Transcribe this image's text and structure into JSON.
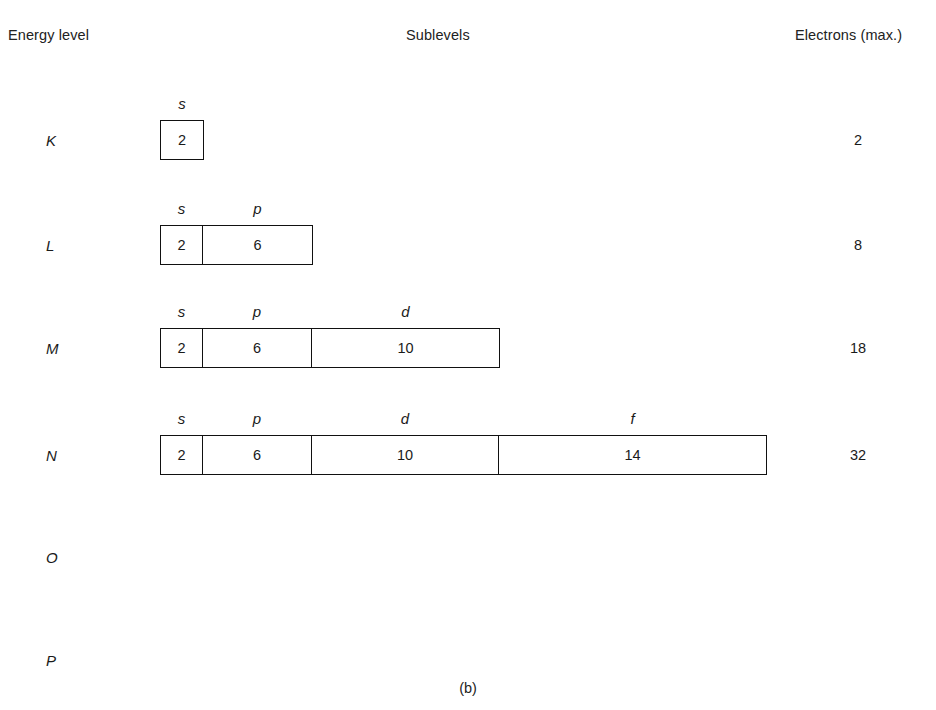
{
  "headers": {
    "energy_level": "Energy level",
    "sublevels": "Sublevels",
    "electrons_max": "Electrons (max.)"
  },
  "caption": "(b)",
  "rows": [
    {
      "level": "K",
      "y": 140,
      "electrons": "2",
      "cells": [
        {
          "label": "s",
          "value": "2",
          "width_class": "w-s"
        }
      ]
    },
    {
      "level": "L",
      "y": 245,
      "electrons": "8",
      "cells": [
        {
          "label": "s",
          "value": "2",
          "width_class": "w-s"
        },
        {
          "label": "p",
          "value": "6",
          "width_class": "w-p"
        }
      ]
    },
    {
      "level": "M",
      "y": 348,
      "electrons": "18",
      "cells": [
        {
          "label": "s",
          "value": "2",
          "width_class": "w-s"
        },
        {
          "label": "p",
          "value": "6",
          "width_class": "w-p"
        },
        {
          "label": "d",
          "value": "10",
          "width_class": "w-d"
        }
      ]
    },
    {
      "level": "N",
      "y": 455,
      "electrons": "32",
      "cells": [
        {
          "label": "s",
          "value": "2",
          "width_class": "w-s"
        },
        {
          "label": "p",
          "value": "6",
          "width_class": "w-p"
        },
        {
          "label": "d",
          "value": "10",
          "width_class": "w-d"
        },
        {
          "label": "f",
          "value": "14",
          "width_class": "w-f"
        }
      ]
    },
    {
      "level": "O",
      "y": 557,
      "electrons": "",
      "cells": []
    },
    {
      "level": "P",
      "y": 660,
      "electrons": "",
      "cells": []
    }
  ]
}
